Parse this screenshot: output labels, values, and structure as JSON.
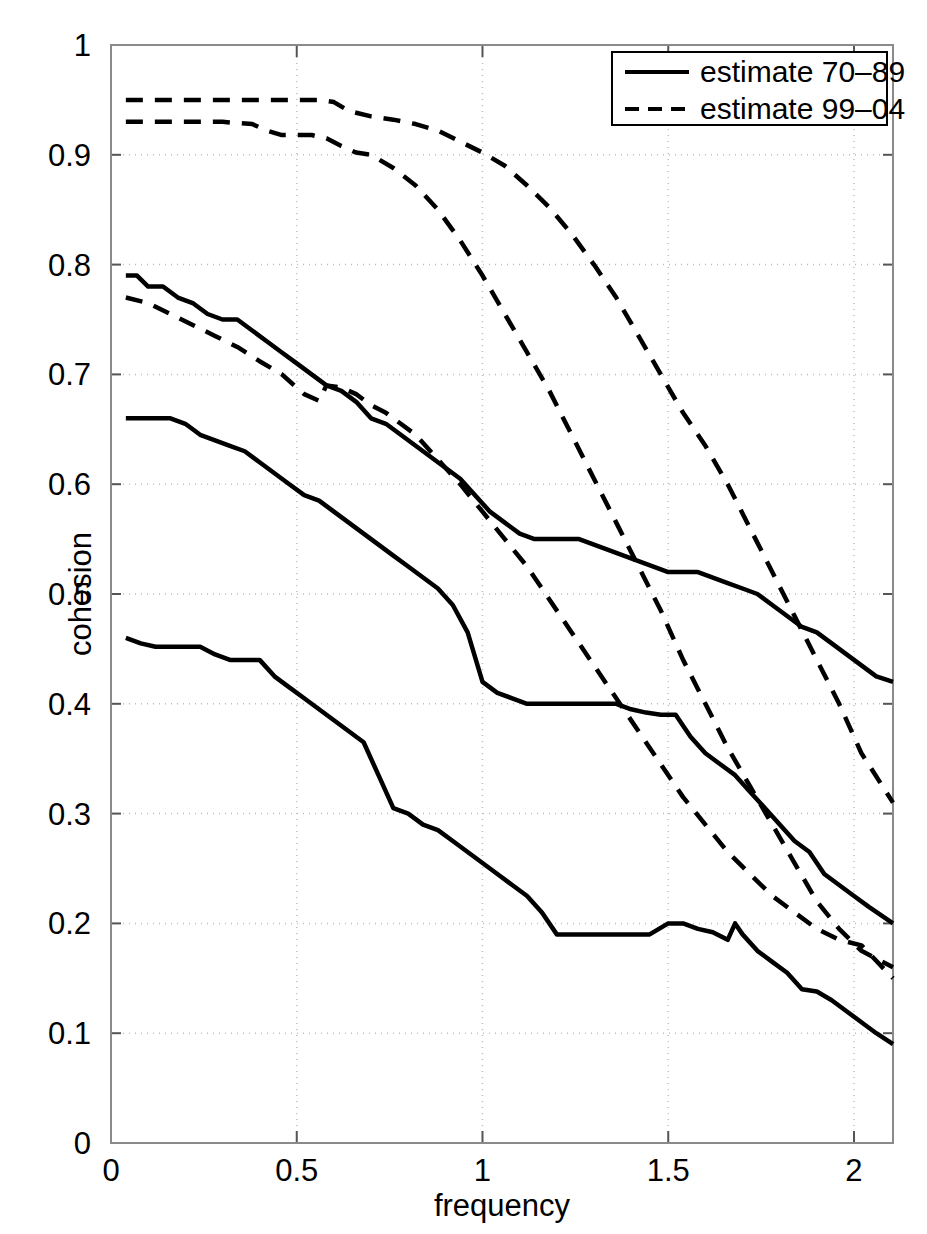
{
  "figure": {
    "background": "#ffffff",
    "line_color": "#000000",
    "axis_color": "#808080",
    "grid_color": "#bbbbbb"
  },
  "axes": {
    "x": {
      "label": "frequency",
      "ticks": [
        0,
        0.5,
        1,
        1.5,
        2
      ],
      "tick_labels": [
        "0",
        "0.5",
        "1",
        "1.5",
        "2"
      ],
      "range": [
        0,
        2.105
      ]
    },
    "y": {
      "label": "cohesion",
      "ticks": [
        0,
        0.1,
        0.2,
        0.3,
        0.4,
        0.5,
        0.6,
        0.7,
        0.8,
        0.9,
        1
      ],
      "tick_labels": [
        "0",
        "0.1",
        "0.2",
        "0.3",
        "0.4",
        "0.5",
        "0.6",
        "0.7",
        "0.8",
        "0.9",
        "1"
      ],
      "range": [
        0,
        1
      ]
    }
  },
  "legend": {
    "position": "top-right",
    "entries": [
      {
        "label": "estimate 70–89",
        "style": "solid"
      },
      {
        "label": "estimate 99–04",
        "style": "dashed"
      }
    ]
  },
  "chart_data": {
    "type": "line",
    "title": "",
    "xlabel": "frequency",
    "ylabel": "cohesion",
    "xlim": [
      0,
      2.105
    ],
    "ylim": [
      0,
      1
    ],
    "grid": true,
    "legend_position": "top-right",
    "series": [
      {
        "name": "estimate 70-89 upper",
        "style": "solid",
        "x": [
          0.04,
          0.07,
          0.1,
          0.14,
          0.18,
          0.22,
          0.26,
          0.3,
          0.34,
          0.38,
          0.42,
          0.46,
          0.5,
          0.54,
          0.58,
          0.62,
          0.66,
          0.7,
          0.74,
          0.78,
          0.82,
          0.86,
          0.9,
          0.94,
          0.98,
          1.02,
          1.06,
          1.1,
          1.14,
          1.18,
          1.22,
          1.26,
          1.3,
          1.34,
          1.38,
          1.42,
          1.46,
          1.5,
          1.54,
          1.58,
          1.62,
          1.66,
          1.7,
          1.74,
          1.78,
          1.82,
          1.86,
          1.9,
          1.94,
          1.98,
          2.02,
          2.06,
          2.105
        ],
        "y": [
          0.79,
          0.79,
          0.78,
          0.78,
          0.77,
          0.765,
          0.755,
          0.75,
          0.75,
          0.74,
          0.73,
          0.72,
          0.71,
          0.7,
          0.69,
          0.685,
          0.675,
          0.66,
          0.655,
          0.645,
          0.635,
          0.625,
          0.615,
          0.605,
          0.59,
          0.575,
          0.565,
          0.555,
          0.55,
          0.55,
          0.55,
          0.55,
          0.545,
          0.54,
          0.535,
          0.53,
          0.525,
          0.52,
          0.52,
          0.52,
          0.515,
          0.51,
          0.505,
          0.5,
          0.49,
          0.48,
          0.47,
          0.465,
          0.455,
          0.445,
          0.435,
          0.425,
          0.42
        ]
      },
      {
        "name": "estimate 70-89 middle",
        "style": "solid",
        "x": [
          0.04,
          0.08,
          0.12,
          0.16,
          0.2,
          0.24,
          0.28,
          0.32,
          0.36,
          0.4,
          0.44,
          0.48,
          0.52,
          0.56,
          0.6,
          0.64,
          0.68,
          0.72,
          0.76,
          0.8,
          0.84,
          0.88,
          0.92,
          0.96,
          1.0,
          1.04,
          1.08,
          1.12,
          1.16,
          1.2,
          1.24,
          1.28,
          1.32,
          1.36,
          1.4,
          1.44,
          1.48,
          1.52,
          1.56,
          1.6,
          1.64,
          1.68,
          1.72,
          1.76,
          1.8,
          1.84,
          1.88,
          1.92,
          1.96,
          2.0,
          2.04,
          2.105
        ],
        "y": [
          0.66,
          0.66,
          0.66,
          0.66,
          0.655,
          0.645,
          0.64,
          0.635,
          0.63,
          0.62,
          0.61,
          0.6,
          0.59,
          0.585,
          0.575,
          0.565,
          0.555,
          0.545,
          0.535,
          0.525,
          0.515,
          0.505,
          0.49,
          0.465,
          0.42,
          0.41,
          0.405,
          0.4,
          0.4,
          0.4,
          0.4,
          0.4,
          0.4,
          0.4,
          0.395,
          0.392,
          0.39,
          0.39,
          0.37,
          0.355,
          0.345,
          0.335,
          0.32,
          0.305,
          0.29,
          0.275,
          0.265,
          0.245,
          0.235,
          0.225,
          0.215,
          0.2
        ]
      },
      {
        "name": "estimate 70-89 lower",
        "style": "solid",
        "x": [
          0.04,
          0.08,
          0.12,
          0.16,
          0.2,
          0.24,
          0.28,
          0.32,
          0.36,
          0.4,
          0.44,
          0.48,
          0.52,
          0.56,
          0.6,
          0.64,
          0.68,
          0.72,
          0.76,
          0.8,
          0.84,
          0.88,
          0.92,
          0.96,
          1.0,
          1.04,
          1.08,
          1.12,
          1.16,
          1.2,
          1.3,
          1.4,
          1.45,
          1.5,
          1.54,
          1.58,
          1.62,
          1.66,
          1.68,
          1.7,
          1.74,
          1.78,
          1.82,
          1.86,
          1.9,
          1.94,
          1.98,
          2.02,
          2.06,
          2.105
        ],
        "y": [
          0.46,
          0.455,
          0.452,
          0.452,
          0.452,
          0.452,
          0.445,
          0.44,
          0.44,
          0.44,
          0.425,
          0.415,
          0.405,
          0.395,
          0.385,
          0.375,
          0.365,
          0.335,
          0.305,
          0.3,
          0.29,
          0.285,
          0.275,
          0.265,
          0.255,
          0.245,
          0.235,
          0.225,
          0.21,
          0.19,
          0.19,
          0.19,
          0.19,
          0.2,
          0.2,
          0.195,
          0.192,
          0.185,
          0.2,
          0.19,
          0.175,
          0.165,
          0.155,
          0.14,
          0.138,
          0.13,
          0.12,
          0.11,
          0.1,
          0.09
        ]
      },
      {
        "name": "estimate 99-04 upper",
        "style": "dashed",
        "x": [
          0.04,
          0.1,
          0.2,
          0.3,
          0.4,
          0.5,
          0.56,
          0.6,
          0.64,
          0.7,
          0.76,
          0.82,
          0.88,
          0.94,
          1.0,
          1.06,
          1.12,
          1.18,
          1.24,
          1.3,
          1.36,
          1.42,
          1.48,
          1.54,
          1.6,
          1.66,
          1.72,
          1.78,
          1.84,
          1.9,
          1.96,
          2.02,
          2.105
        ],
        "y": [
          0.95,
          0.95,
          0.95,
          0.95,
          0.95,
          0.95,
          0.95,
          0.948,
          0.94,
          0.935,
          0.932,
          0.928,
          0.922,
          0.912,
          0.902,
          0.89,
          0.872,
          0.852,
          0.828,
          0.8,
          0.77,
          0.735,
          0.7,
          0.665,
          0.635,
          0.6,
          0.56,
          0.52,
          0.48,
          0.44,
          0.4,
          0.355,
          0.31
        ]
      },
      {
        "name": "estimate 99-04 middle",
        "style": "dashed",
        "x": [
          0.04,
          0.1,
          0.2,
          0.3,
          0.38,
          0.42,
          0.46,
          0.5,
          0.54,
          0.58,
          0.62,
          0.66,
          0.7,
          0.76,
          0.82,
          0.88,
          0.94,
          1.0,
          1.06,
          1.12,
          1.18,
          1.24,
          1.3,
          1.36,
          1.42,
          1.48,
          1.54,
          1.6,
          1.66,
          1.72,
          1.78,
          1.84,
          1.9,
          1.96,
          2.02,
          2.105
        ],
        "y": [
          0.93,
          0.93,
          0.93,
          0.93,
          0.928,
          0.922,
          0.918,
          0.918,
          0.918,
          0.915,
          0.908,
          0.902,
          0.9,
          0.888,
          0.872,
          0.85,
          0.822,
          0.79,
          0.755,
          0.72,
          0.685,
          0.645,
          0.605,
          0.565,
          0.525,
          0.485,
          0.44,
          0.4,
          0.36,
          0.325,
          0.29,
          0.255,
          0.22,
          0.195,
          0.175,
          0.16
        ]
      },
      {
        "name": "estimate 99-04 lower",
        "style": "dashed",
        "x": [
          0.04,
          0.1,
          0.16,
          0.22,
          0.28,
          0.34,
          0.4,
          0.46,
          0.52,
          0.56,
          0.58,
          0.62,
          0.66,
          0.7,
          0.74,
          0.78,
          0.82,
          0.86,
          0.9,
          0.94,
          1.0,
          1.06,
          1.12,
          1.18,
          1.24,
          1.3,
          1.36,
          1.42,
          1.48,
          1.54,
          1.6,
          1.66,
          1.72,
          1.78,
          1.84,
          1.9,
          1.96,
          2.02,
          2.105
        ],
        "y": [
          0.77,
          0.765,
          0.755,
          0.745,
          0.735,
          0.725,
          0.712,
          0.7,
          0.682,
          0.676,
          0.69,
          0.688,
          0.682,
          0.672,
          0.665,
          0.655,
          0.645,
          0.63,
          0.615,
          0.6,
          0.575,
          0.55,
          0.525,
          0.495,
          0.465,
          0.435,
          0.405,
          0.375,
          0.345,
          0.315,
          0.29,
          0.265,
          0.245,
          0.225,
          0.21,
          0.195,
          0.185,
          0.18,
          0.15
        ]
      }
    ]
  }
}
